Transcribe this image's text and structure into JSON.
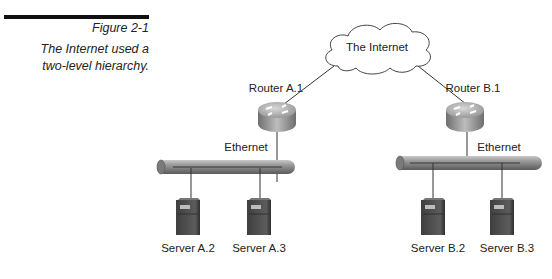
{
  "figure": {
    "number": "Figure 2-1",
    "title_line1": "The Internet used a",
    "title_line2": "two-level hierarchy."
  },
  "diagram": {
    "cloud_label": "The Internet",
    "routers": [
      {
        "label": "Router A.1"
      },
      {
        "label": "Router B.1"
      }
    ],
    "segments": [
      {
        "label": "Ethernet"
      },
      {
        "label": "Ethernet"
      }
    ],
    "servers": [
      {
        "label": "Server A.2"
      },
      {
        "label": "Server A.3"
      },
      {
        "label": "Server B.2"
      },
      {
        "label": "Server B.3"
      }
    ]
  },
  "colors": {
    "line": "#333333",
    "router_top": "#b8b8b8",
    "bus": "#8a8a8a",
    "server": "#555555"
  }
}
